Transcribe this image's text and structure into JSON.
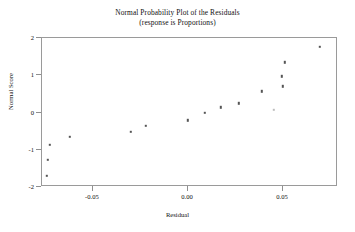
{
  "chart_data": {
    "type": "scatter",
    "title": "Normal Probability Plot of the Residuals",
    "subtitle": "(response is Proportions)",
    "xlabel": "Residual",
    "ylabel": "Normal Score",
    "xlim": [
      -0.0768,
      0.0789
    ],
    "ylim": [
      -2.0,
      2.0
    ],
    "xticks": [
      -0.05,
      0.0,
      0.05
    ],
    "xticklabels": [
      "-0.05",
      "0.00",
      "0.05"
    ],
    "yticks": [
      -2,
      -1,
      0,
      1,
      2
    ],
    "yticklabels": [
      "-2",
      "-1",
      "0",
      "1",
      "2"
    ],
    "grid": false,
    "legend": null,
    "marker": "square",
    "marker_color": "#555555",
    "points": [
      {
        "x": -0.0737,
        "y": -1.73,
        "faint": false
      },
      {
        "x": -0.0721,
        "y": -0.89,
        "faint": false
      },
      {
        "x": -0.0732,
        "y": -1.3,
        "faint": false
      },
      {
        "x": -0.0615,
        "y": -0.68,
        "faint": false
      },
      {
        "x": -0.0295,
        "y": -0.54,
        "faint": false
      },
      {
        "x": -0.0216,
        "y": -0.38,
        "faint": false
      },
      {
        "x": 0.0005,
        "y": -0.24,
        "faint": false
      },
      {
        "x": 0.0095,
        "y": -0.03,
        "faint": false
      },
      {
        "x": 0.0179,
        "y": 0.11,
        "faint": false
      },
      {
        "x": 0.0274,
        "y": 0.22,
        "faint": false
      },
      {
        "x": 0.0395,
        "y": 0.54,
        "faint": false
      },
      {
        "x": 0.0458,
        "y": 0.05,
        "faint": true
      },
      {
        "x": 0.05,
        "y": 0.95,
        "faint": false
      },
      {
        "x": 0.0505,
        "y": 0.68,
        "faint": false
      },
      {
        "x": 0.0516,
        "y": 1.32,
        "faint": false
      },
      {
        "x": 0.07,
        "y": 1.73,
        "faint": false
      }
    ]
  }
}
